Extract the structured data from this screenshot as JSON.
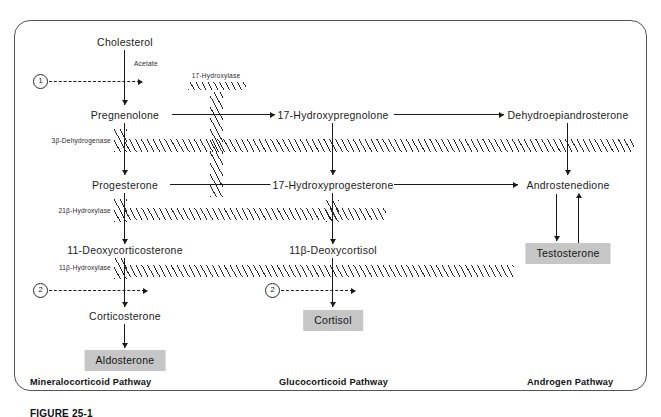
{
  "figure": {
    "caption": "FIGURE 25-1"
  },
  "nodes": {
    "cholesterol": "Cholesterol",
    "pregnenolone": "Pregnenolone",
    "progesterone": "Progesterone",
    "deoxycorticosterone": "11-Deoxycorticosterone",
    "corticosterone": "Corticosterone",
    "aldosterone": "Aldosterone",
    "hydroxypregnenolone": "17-Hydroxypregnolone",
    "hydroxyprogesterone": "17-Hydroxyprogesterone",
    "deoxycortisol": "11β-Deoxycortisol",
    "cortisol": "Cortisol",
    "dhea": "Dehydroepiandrosterone",
    "androstenedione": "Androstenedione",
    "testosterone": "Testosterone"
  },
  "enzymes": {
    "acetate": "Acetate",
    "hydroxylase17": "17-Hydroxylase",
    "dehydrogenase3b": "3β-Dehydrogenase",
    "hydroxylase21b": "21β-Hydroxylase",
    "hydroxylase11b": "11β-Hydroxylase"
  },
  "step_markers": {
    "one": "1",
    "two_mineralo": "2",
    "two_gluco": "2"
  },
  "pathways": {
    "mineralocorticoid": "Mineralocorticoid Pathway",
    "glucocorticoid": "Glucocorticoid Pathway",
    "androgen": "Androgen Pathway"
  },
  "colors": {
    "box_fill": "#c6c6c6",
    "line": "#1a1a1a",
    "panel_border": "#555555",
    "background": "#ffffff"
  }
}
